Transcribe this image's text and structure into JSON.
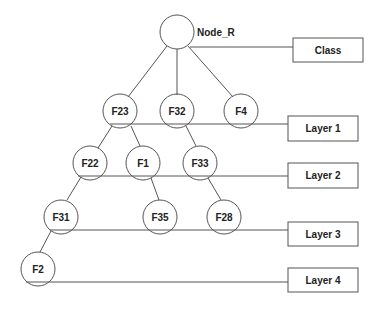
{
  "diagram": {
    "type": "tree",
    "root": {
      "id": "node_r",
      "label": "",
      "side_label": "Node_R"
    },
    "nodes": [
      {
        "id": "f23",
        "label": "F23",
        "layer": 1
      },
      {
        "id": "f32",
        "label": "F32",
        "layer": 1
      },
      {
        "id": "f4",
        "label": "F4",
        "layer": 1
      },
      {
        "id": "f22",
        "label": "F22",
        "layer": 2
      },
      {
        "id": "f1",
        "label": "F1",
        "layer": 2
      },
      {
        "id": "f33",
        "label": "F33",
        "layer": 2
      },
      {
        "id": "f31",
        "label": "F31",
        "layer": 3
      },
      {
        "id": "f35",
        "label": "F35",
        "layer": 3
      },
      {
        "id": "f28",
        "label": "F28",
        "layer": 3
      },
      {
        "id": "f2",
        "label": "F2",
        "layer": 4
      }
    ],
    "edges": [
      [
        "node_r",
        "f23"
      ],
      [
        "node_r",
        "f32"
      ],
      [
        "node_r",
        "f4"
      ],
      [
        "f23",
        "f22"
      ],
      [
        "f23",
        "f1"
      ],
      [
        "f32",
        "f33"
      ],
      [
        "f22",
        "f31"
      ],
      [
        "f1",
        "f35"
      ],
      [
        "f33",
        "f28"
      ],
      [
        "f31",
        "f2"
      ]
    ],
    "layer_boxes": [
      {
        "id": "class",
        "label": "Class"
      },
      {
        "id": "layer1",
        "label": "Layer 1"
      },
      {
        "id": "layer2",
        "label": "Layer 2"
      },
      {
        "id": "layer3",
        "label": "Layer 3"
      },
      {
        "id": "layer4",
        "label": "Layer 4"
      }
    ],
    "colors": {
      "stroke": "#555555",
      "text": "#222222",
      "background": "#ffffff"
    }
  }
}
